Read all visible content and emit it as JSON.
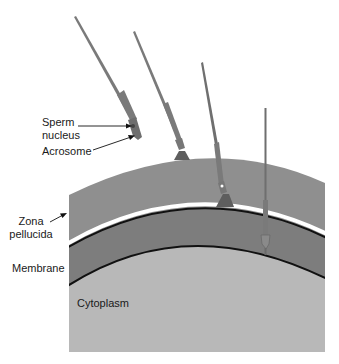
{
  "labels": {
    "sperm_nucleus_line1": "Sperm",
    "sperm_nucleus_line2": "nucleus",
    "acrosome": "Acrosome",
    "zona_line1": "Zona",
    "zona_line2": "pellucida",
    "membrane": "Membrane",
    "cytoplasm": "Cytoplasm"
  },
  "colors": {
    "zona": "#8f8f8f",
    "zona_inner": "#7e7e7e",
    "cytoplasm": "#b9b9b9",
    "sperm": "#7a7a7a",
    "line": "#111111",
    "white_gap": "#ffffff"
  },
  "sperm_stages": [
    {
      "stage": 1,
      "description": "approaching with intact acrosome"
    },
    {
      "stage": 2,
      "description": "acrosome reaction at zona surface"
    },
    {
      "stage": 3,
      "description": "penetrating zona pellucida"
    },
    {
      "stage": 4,
      "description": "fusing with membrane"
    }
  ]
}
